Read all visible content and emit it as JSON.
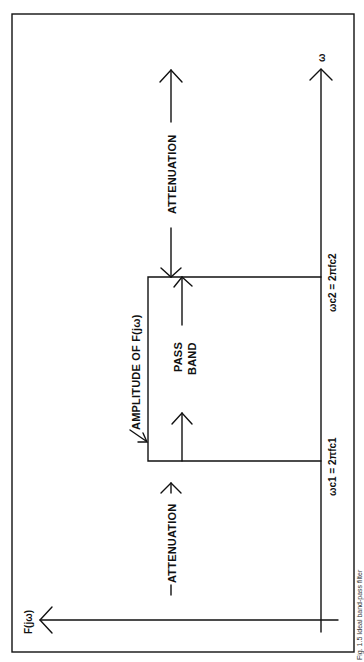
{
  "diagram": {
    "orientation": "rotated-90-ccw",
    "axes": {
      "vertical_axis_label": "F(jω)",
      "horizontal_axis_label": "ω"
    },
    "labels": {
      "attenuation_upper": "ATTENUATION",
      "attenuation_lower": "ATTENUATION",
      "pass_band_line1": "PASS",
      "pass_band_line2": "BAND",
      "amplitude": "AMPLITUDE OF F(jω)"
    },
    "cutoffs": {
      "lower": "ωc1 = 2πfc1",
      "upper": "ωc2 = 2πfc2"
    },
    "caption_partial": "Fig. 1.5  Ideal band-pass filter",
    "colors": {
      "ink": "#111111",
      "background": "#ffffff"
    }
  }
}
